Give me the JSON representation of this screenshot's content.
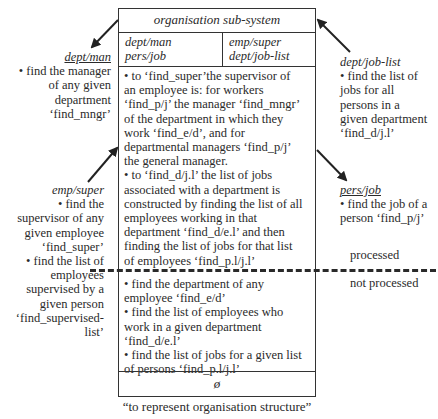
{
  "subsystem": {
    "title": "organisation sub-system",
    "header_left": [
      "dept/man",
      "pers/job"
    ],
    "header_right": [
      "emp/super",
      "dept/job-list"
    ],
    "processed_text": [
      "• to ‘find_super’the supervisor of",
      "an employee is: for workers",
      "‘find_p/j’ the manager ‘find_mngr’",
      "of the department in which they",
      "work ‘find_e/d’, and for",
      "departmental managers ‘find_p/j’",
      "the general manager.",
      "• to ‘find_d/j.l’ the list of jobs",
      "associated with a department is",
      "constructed by finding the list of all",
      "employees working in that",
      "department ‘find_d/e.l’ and then",
      "finding the list of jobs for that list",
      "of employees ‘find_p.l/j.l’"
    ],
    "not_processed_text": [
      "• find the department of any",
      "employee ‘find_e/d’",
      "• find the list of employees who",
      "work in a given department",
      "‘find_d/e.l’",
      "• find the list of jobs for a given list",
      "of persons ‘find_p.l/j.l’"
    ],
    "empty_symbol": "ø",
    "caption": "“to represent organisation structure”"
  },
  "left_annotations": {
    "dept_man": {
      "label": "dept/man",
      "lines": [
        "• find the manager",
        "of any given",
        "department",
        "‘find_mngr’"
      ]
    },
    "emp_super": {
      "label": "emp/super",
      "lines": [
        "• find the",
        "supervisor of any",
        "given employee",
        "‘find_super’",
        "• find the list of",
        "employees",
        "supervised by a",
        "given person",
        "‘find_supervised-",
        "list’"
      ]
    }
  },
  "right_annotations": {
    "dept_job_list": {
      "label": "dept/job-list",
      "lines": [
        "• find the list of",
        "jobs for all",
        "persons in a",
        "given department",
        "‘find_d/j.l’"
      ]
    },
    "pers_job": {
      "label": "pers/job",
      "lines": [
        "• find the job of a",
        "person ‘find_p/j’"
      ]
    }
  },
  "status_labels": {
    "processed": "processed",
    "not_processed": "not processed"
  }
}
